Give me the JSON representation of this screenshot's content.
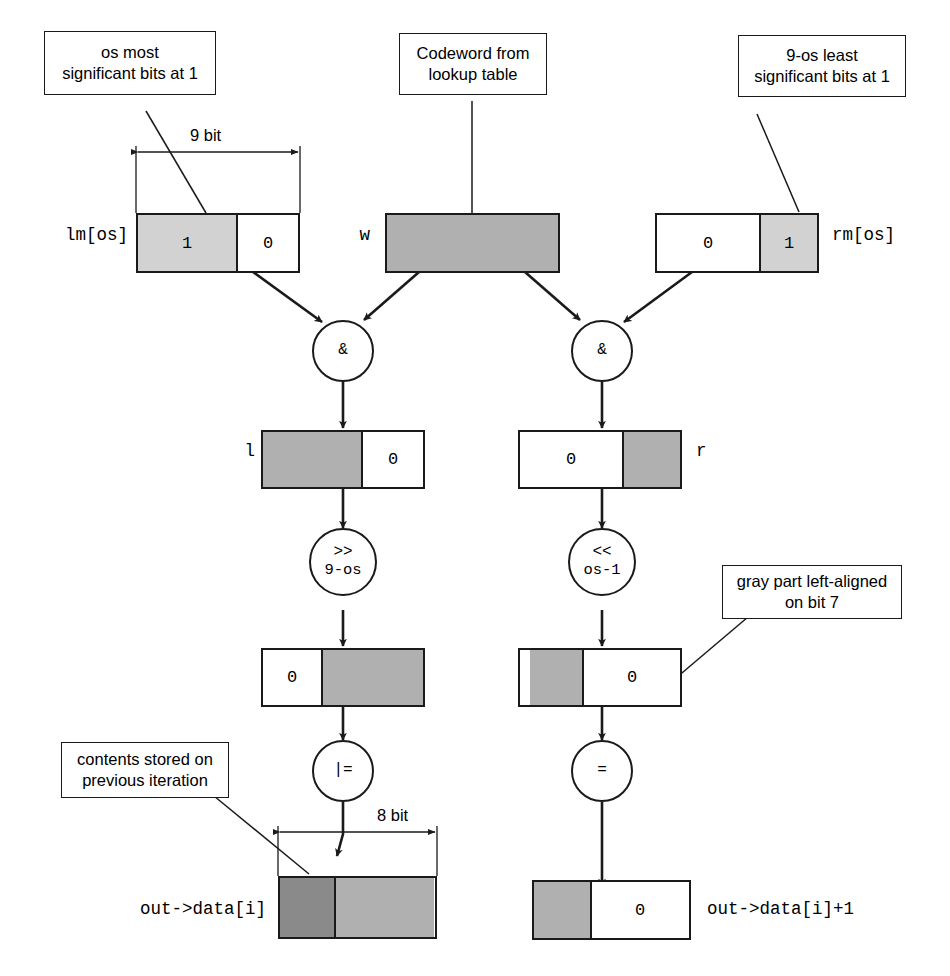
{
  "diagram": {
    "callouts": [
      {
        "id": "lm-note",
        "text": "os most\nsignificant bits at 1"
      },
      {
        "id": "w-note",
        "text": "Codeword from\nlookup table"
      },
      {
        "id": "rm-note",
        "text": "9-os least\nsignificant bits at 1"
      },
      {
        "id": "align-note",
        "text": "gray part left-aligned\non bit 7"
      },
      {
        "id": "prev-note",
        "text": "contents stored on\nprevious iteration"
      }
    ],
    "dimensions": [
      {
        "id": "dim-9bit",
        "text": "9 bit"
      },
      {
        "id": "dim-8bit",
        "text": "8 bit"
      }
    ],
    "registers": [
      {
        "id": "lm",
        "label": "lm[os]",
        "label_side": "left",
        "cells": [
          {
            "text": "1",
            "fill": "light"
          },
          {
            "text": "0",
            "fill": "white"
          }
        ]
      },
      {
        "id": "w",
        "label": "w",
        "label_side": "left",
        "cells": [
          {
            "text": "",
            "fill": "mid"
          }
        ]
      },
      {
        "id": "rm",
        "label": "rm[os]",
        "label_side": "right",
        "cells": [
          {
            "text": "0",
            "fill": "white"
          },
          {
            "text": "1",
            "fill": "light"
          }
        ]
      },
      {
        "id": "l",
        "label": "l",
        "label_side": "left",
        "cells": [
          {
            "text": "",
            "fill": "mid"
          },
          {
            "text": "0",
            "fill": "white"
          }
        ]
      },
      {
        "id": "r",
        "label": "r",
        "label_side": "right",
        "cells": [
          {
            "text": "0",
            "fill": "white"
          },
          {
            "text": "",
            "fill": "mid"
          }
        ]
      },
      {
        "id": "l-shifted",
        "label": "",
        "label_side": "none",
        "cells": [
          {
            "text": "0",
            "fill": "white"
          },
          {
            "text": "",
            "fill": "mid"
          }
        ]
      },
      {
        "id": "r-shifted",
        "label": "",
        "label_side": "none",
        "cells": [
          {
            "text": "",
            "fill": "white"
          },
          {
            "text": "",
            "fill": "mid"
          },
          {
            "text": "0",
            "fill": "white"
          }
        ]
      },
      {
        "id": "out-data-i",
        "label": "out->data[i]",
        "label_side": "left",
        "cells": [
          {
            "text": "",
            "fill": "dark"
          },
          {
            "text": "",
            "fill": "mid"
          }
        ]
      },
      {
        "id": "out-data-i1",
        "label": "out->data[i]+1",
        "label_side": "right",
        "cells": [
          {
            "text": "",
            "fill": "mid"
          },
          {
            "text": "0",
            "fill": "white"
          }
        ]
      }
    ],
    "operators": [
      {
        "id": "and-left",
        "line1": "&",
        "line2": ""
      },
      {
        "id": "and-right",
        "line1": "&",
        "line2": ""
      },
      {
        "id": "shr",
        "line1": ">>",
        "line2": "9-os"
      },
      {
        "id": "shl",
        "line1": "<<",
        "line2": "os-1"
      },
      {
        "id": "orassign",
        "line1": "|=",
        "line2": ""
      },
      {
        "id": "assign",
        "line1": "=",
        "line2": ""
      }
    ],
    "colors": {
      "stroke": "#1a1a1a",
      "fill_white": "#ffffff",
      "fill_light": "#d2d2d2",
      "fill_mid": "#b0b0b0",
      "fill_dark": "#8a8a8a"
    }
  }
}
